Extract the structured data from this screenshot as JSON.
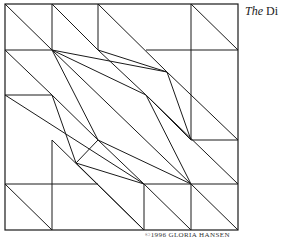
{
  "title": {
    "prefix": "The",
    "rest": "Di"
  },
  "credit": "©1996 GLORIA HANSEN",
  "diagram": {
    "stroke": "#1a1a1a",
    "frame": [
      5,
      4,
      238,
      230
    ],
    "lines": [
      [
        5,
        4,
        52,
        50
      ],
      [
        52,
        4,
        52,
        50
      ],
      [
        52,
        4,
        98,
        50
      ],
      [
        98,
        4,
        98,
        50
      ],
      [
        98,
        4,
        167,
        72
      ],
      [
        191,
        4,
        191,
        140
      ],
      [
        191,
        4,
        238,
        50
      ],
      [
        5,
        50,
        52,
        50
      ],
      [
        146,
        50,
        238,
        50
      ],
      [
        5,
        50,
        52,
        95
      ],
      [
        52,
        50,
        167,
        72
      ],
      [
        52,
        50,
        146,
        95
      ],
      [
        52,
        50,
        98,
        140
      ],
      [
        52,
        50,
        191,
        184
      ],
      [
        98,
        50,
        167,
        72
      ],
      [
        98,
        50,
        146,
        95
      ],
      [
        167,
        72,
        191,
        140
      ],
      [
        167,
        72,
        238,
        140
      ],
      [
        5,
        95,
        52,
        95
      ],
      [
        5,
        95,
        144,
        184
      ],
      [
        52,
        95,
        76,
        163
      ],
      [
        52,
        95,
        98,
        140
      ],
      [
        146,
        95,
        191,
        140
      ],
      [
        146,
        95,
        191,
        184
      ],
      [
        146,
        95,
        238,
        184
      ],
      [
        191,
        140,
        238,
        140
      ],
      [
        98,
        140,
        76,
        163
      ],
      [
        98,
        140,
        191,
        184
      ],
      [
        98,
        140,
        144,
        184
      ],
      [
        76,
        163,
        144,
        184
      ],
      [
        76,
        163,
        144,
        230
      ],
      [
        52,
        140,
        52,
        230
      ],
      [
        52,
        140,
        144,
        230
      ],
      [
        5,
        184,
        98,
        184
      ],
      [
        144,
        184,
        238,
        184
      ],
      [
        5,
        184,
        52,
        230
      ],
      [
        144,
        184,
        144,
        230
      ],
      [
        144,
        184,
        191,
        230
      ],
      [
        191,
        184,
        191,
        230
      ],
      [
        191,
        184,
        238,
        230
      ]
    ]
  }
}
